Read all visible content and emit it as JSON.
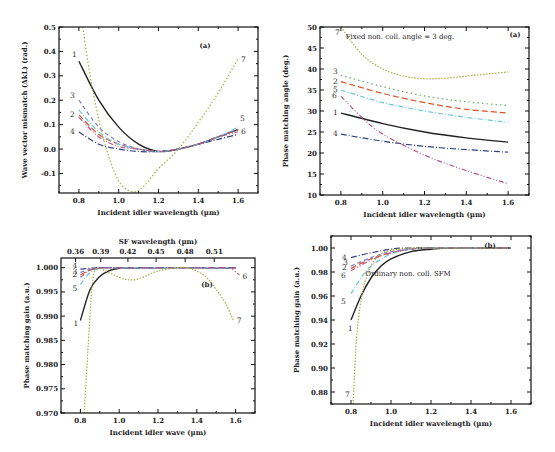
{
  "chart_data": [
    {
      "id": "top-left",
      "type": "line",
      "panel_label": "(a)",
      "title": "",
      "xlabel": "Incident idler wavelength (µm)",
      "ylabel": "Wave vector mismatch (ΔkL) (rad.)",
      "xlim": [
        0.7,
        1.7
      ],
      "ylim": [
        -0.18,
        0.5
      ],
      "xticks": [
        0.8,
        1.0,
        1.2,
        1.4,
        1.6
      ],
      "xtick_labels": [
        "0.8",
        "1.0",
        "1.2",
        "1.4",
        "1.6"
      ],
      "yticks": [
        -0.1,
        0.0,
        0.1,
        0.2,
        0.3,
        0.4,
        0.5
      ],
      "ytick_labels": [
        "-0.1",
        "0.0",
        "0.1",
        "0.2",
        "0.3",
        "0.4",
        "0.5"
      ],
      "grid": false,
      "series": [
        {
          "name": "1",
          "color": "#222222",
          "dash": "",
          "x": [
            0.8,
            0.9,
            1.0,
            1.1,
            1.2,
            1.3,
            1.4,
            1.5,
            1.6
          ],
          "y": [
            0.36,
            0.2,
            0.09,
            0.02,
            -0.01,
            0.0,
            0.02,
            0.05,
            0.08
          ]
        },
        {
          "name": "2",
          "color": "#d9532b",
          "dash": "6,3",
          "x": [
            0.8,
            0.9,
            1.0,
            1.1,
            1.2,
            1.3,
            1.4,
            1.5,
            1.6
          ],
          "y": [
            0.14,
            0.06,
            0.02,
            0.0,
            -0.01,
            0.0,
            0.02,
            0.05,
            0.08
          ]
        },
        {
          "name": "3",
          "color": "#7a7ad0",
          "dash": "4,3",
          "x": [
            0.8,
            0.9,
            1.0,
            1.1,
            1.2,
            1.3,
            1.4,
            1.5,
            1.6
          ],
          "y": [
            0.2,
            0.09,
            0.03,
            0.0,
            -0.01,
            0.0,
            0.02,
            0.05,
            0.08
          ]
        },
        {
          "name": "4",
          "color": "#33407a",
          "dash": "6,2,1,2",
          "x": [
            0.8,
            0.9,
            1.0,
            1.1,
            1.2,
            1.3,
            1.4,
            1.5,
            1.6
          ],
          "y": [
            0.07,
            0.02,
            0.0,
            -0.01,
            -0.01,
            0.0,
            0.02,
            0.04,
            0.06
          ]
        },
        {
          "name": "5",
          "color": "#6cc7d6",
          "dash": "5,2,1,2",
          "x": [
            0.8,
            0.9,
            1.0,
            1.1,
            1.2,
            1.3,
            1.4,
            1.5,
            1.6
          ],
          "y": [
            0.16,
            0.07,
            0.02,
            0.0,
            -0.01,
            0.0,
            0.02,
            0.05,
            0.09
          ]
        },
        {
          "name": "6",
          "color": "#b05a8a",
          "dash": "5,2,1,2,1,2",
          "x": [
            0.8,
            0.9,
            1.0,
            1.1,
            1.2,
            1.3,
            1.4,
            1.5,
            1.6
          ],
          "y": [
            0.13,
            0.05,
            0.01,
            0.0,
            -0.01,
            0.0,
            0.02,
            0.05,
            0.07
          ]
        },
        {
          "name": "7",
          "color": "#a8b040",
          "dash": "1.5,2",
          "x": [
            0.82,
            0.85,
            0.9,
            0.95,
            1.0,
            1.05,
            1.1,
            1.15,
            1.2,
            1.3,
            1.4,
            1.5,
            1.6
          ],
          "y": [
            0.5,
            0.33,
            0.12,
            -0.03,
            -0.13,
            -0.17,
            -0.17,
            -0.13,
            -0.08,
            0.0,
            0.11,
            0.23,
            0.37
          ]
        }
      ]
    },
    {
      "id": "top-right",
      "type": "line",
      "panel_label": "(a)",
      "annotation": "Fixed non. coll. angle = 3 deg.",
      "xlabel": "Incident idler wavelength (µm)",
      "ylabel": "Phase matching angle (deg.)",
      "xlim": [
        0.7,
        1.7
      ],
      "ylim": [
        10,
        50
      ],
      "xticks": [
        0.8,
        1.0,
        1.2,
        1.4,
        1.6
      ],
      "xtick_labels": [
        "0.8",
        "1.0",
        "1.2",
        "1.4",
        "1.6"
      ],
      "yticks": [
        10,
        15,
        20,
        25,
        30,
        35,
        40,
        45,
        50
      ],
      "ytick_labels": [
        "10",
        "15",
        "20",
        "25",
        "30",
        "35",
        "40",
        "45",
        "50"
      ],
      "grid": false,
      "series": [
        {
          "name": "1",
          "color": "#222222",
          "dash": "",
          "x": [
            0.8,
            1.0,
            1.2,
            1.4,
            1.6
          ],
          "y": [
            29.5,
            27.0,
            25.0,
            23.6,
            22.6
          ]
        },
        {
          "name": "2",
          "color": "#d9532b",
          "dash": "6,3",
          "x": [
            0.8,
            1.0,
            1.2,
            1.4,
            1.6
          ],
          "y": [
            37.0,
            34.2,
            32.0,
            30.4,
            29.5
          ]
        },
        {
          "name": "3",
          "color": "#6aaa6a",
          "dash": "1.5,3",
          "x": [
            0.8,
            1.0,
            1.2,
            1.4,
            1.6
          ],
          "y": [
            38.5,
            35.8,
            33.6,
            32.2,
            31.3
          ]
        },
        {
          "name": "4",
          "color": "#33407a",
          "dash": "6,2,1,2",
          "x": [
            0.8,
            1.0,
            1.2,
            1.4,
            1.6
          ],
          "y": [
            24.5,
            22.8,
            21.6,
            20.8,
            20.2
          ]
        },
        {
          "name": "5",
          "color": "#6cc7d6",
          "dash": "5,2,1,2",
          "x": [
            0.8,
            1.0,
            1.2,
            1.4,
            1.6
          ],
          "y": [
            35.0,
            32.0,
            30.0,
            28.5,
            27.3
          ]
        },
        {
          "name": "6",
          "color": "#b05a8a",
          "dash": "5,2,1,2,1,2",
          "x": [
            0.8,
            0.9,
            1.0,
            1.2,
            1.4,
            1.6
          ],
          "y": [
            33.5,
            28.5,
            24.5,
            19.5,
            15.8,
            12.7
          ]
        },
        {
          "name": "7",
          "color": "#a8b040",
          "dash": "1.5,1.5",
          "x": [
            0.8,
            0.9,
            1.0,
            1.1,
            1.2,
            1.3,
            1.4,
            1.5,
            1.6
          ],
          "y": [
            50.0,
            43.5,
            40.0,
            38.3,
            37.7,
            37.8,
            38.3,
            38.8,
            39.3
          ]
        }
      ]
    },
    {
      "id": "bottom-left",
      "type": "line",
      "panel_label": "(b)",
      "xlabel": "Incident idler wave (µm)",
      "ylabel": "Phase matching gain (a.u.)",
      "x2label": "SF wavelength (µm)",
      "xlim": [
        0.7,
        1.7
      ],
      "ylim": [
        0.97,
        1.002
      ],
      "xticks": [
        0.8,
        1.0,
        1.2,
        1.4,
        1.6
      ],
      "xtick_labels": [
        "0.8",
        "1.0",
        "1.2",
        "1.4",
        "1.6"
      ],
      "x2tick_labels": [
        "0.36",
        "0.39",
        "0.42",
        "0.45",
        "0.48",
        "0.51"
      ],
      "x2tick_positions_x": [
        0.775,
        0.905,
        1.045,
        1.19,
        1.34,
        1.49
      ],
      "yticks": [
        0.97,
        0.975,
        0.98,
        0.985,
        0.99,
        0.995,
        1.0
      ],
      "ytick_labels": [
        "0.970",
        "0.975",
        "0.980",
        "0.985",
        "0.990",
        "0.995",
        "1.000"
      ],
      "grid": false,
      "series": [
        {
          "name": "1",
          "color": "#222222",
          "dash": "",
          "x": [
            0.8,
            0.85,
            0.9,
            0.95,
            1.0,
            1.05,
            1.6
          ],
          "y": [
            0.9891,
            0.9955,
            0.9982,
            0.9994,
            0.9999,
            1.0,
            1.0
          ]
        },
        {
          "name": "2",
          "color": "#d9532b",
          "dash": "6,3",
          "x": [
            0.8,
            0.85,
            0.9,
            1.0,
            1.6
          ],
          "y": [
            0.9985,
            0.9995,
            0.9999,
            1.0,
            1.0
          ]
        },
        {
          "name": "3",
          "color": "#7a7ad0",
          "dash": "4,3",
          "x": [
            0.8,
            0.85,
            0.9,
            1.0,
            1.6
          ],
          "y": [
            0.999,
            0.9997,
            1.0,
            1.0,
            1.0
          ]
        },
        {
          "name": "4",
          "color": "#33407a",
          "dash": "6,2,1,2",
          "x": [
            0.8,
            0.85,
            0.9,
            1.0,
            1.6
          ],
          "y": [
            0.9997,
            0.9999,
            1.0,
            1.0,
            1.0
          ]
        },
        {
          "name": "5",
          "color": "#6cc7d6",
          "dash": "5,2,1,2",
          "x": [
            0.8,
            0.85,
            0.9,
            1.0,
            1.6
          ],
          "y": [
            0.9965,
            0.999,
            0.9998,
            1.0,
            1.0
          ]
        },
        {
          "name": "6",
          "color": "#b05a8a",
          "dash": "5,2,1,2,1,2",
          "x": [
            0.8,
            0.85,
            0.9,
            1.0,
            1.55,
            1.58,
            1.62
          ],
          "y": [
            0.998,
            0.9995,
            0.9999,
            1.0,
            1.0,
            0.9997,
            0.9985
          ]
        },
        {
          "name": "7",
          "color": "#a8b040",
          "dash": "1.5,1.5",
          "x": [
            0.82,
            0.84,
            0.86,
            0.88,
            0.92,
            1.0,
            1.05,
            1.1,
            1.2,
            1.3,
            1.35,
            1.4,
            1.45,
            1.5,
            1.55,
            1.59
          ],
          "y": [
            0.97,
            0.984,
            0.996,
            0.9998,
            0.9995,
            0.998,
            0.9975,
            0.9977,
            0.9993,
            1.0,
            1.0,
            0.9993,
            0.998,
            0.9955,
            0.9925,
            0.989
          ]
        }
      ]
    },
    {
      "id": "bottom-right",
      "type": "line",
      "panel_label": "(b)",
      "annotation": "Ordinary non. coll. SFM",
      "xlabel": "Incident idler wavelength (µm)",
      "ylabel": "Phase matching gain (a.u.)",
      "xlim": [
        0.7,
        1.7
      ],
      "ylim": [
        0.87,
        1.01
      ],
      "xticks": [
        0.8,
        1.0,
        1.2,
        1.4,
        1.6
      ],
      "xtick_labels": [
        "0.8",
        "1.0",
        "1.2",
        "1.4",
        "1.6"
      ],
      "yticks": [
        0.88,
        0.9,
        0.92,
        0.94,
        0.96,
        0.98,
        1.0
      ],
      "ytick_labels": [
        "0.88",
        "0.90",
        "0.92",
        "0.94",
        "0.96",
        "0.98",
        "1.00"
      ],
      "grid": false,
      "series": [
        {
          "name": "1",
          "color": "#222222",
          "dash": "",
          "x": [
            0.8,
            0.85,
            0.9,
            0.95,
            1.0,
            1.1,
            1.2,
            1.3,
            1.6
          ],
          "y": [
            0.94,
            0.96,
            0.975,
            0.985,
            0.991,
            0.997,
            0.999,
            1.0,
            1.0
          ]
        },
        {
          "name": "2",
          "color": "#d9532b",
          "dash": "6,3",
          "x": [
            0.8,
            0.9,
            1.0,
            1.1,
            1.2,
            1.6
          ],
          "y": [
            0.983,
            0.991,
            0.996,
            0.999,
            1.0,
            1.0
          ]
        },
        {
          "name": "3",
          "color": "#7a7ad0",
          "dash": "4,3",
          "x": [
            0.8,
            0.9,
            1.0,
            1.1,
            1.2,
            1.6
          ],
          "y": [
            0.985,
            0.992,
            0.997,
            0.999,
            1.0,
            1.0
          ]
        },
        {
          "name": "4",
          "color": "#33407a",
          "dash": "6,2,1,2",
          "x": [
            0.8,
            0.9,
            1.0,
            1.1,
            1.6
          ],
          "y": [
            0.992,
            0.996,
            0.999,
            1.0,
            1.0
          ]
        },
        {
          "name": "5",
          "color": "#6cc7d6",
          "dash": "5,2,1,2",
          "x": [
            0.8,
            0.85,
            0.9,
            1.0,
            1.1,
            1.2,
            1.6
          ],
          "y": [
            0.962,
            0.975,
            0.985,
            0.995,
            0.999,
            1.0,
            1.0
          ]
        },
        {
          "name": "6",
          "color": "#b05a8a",
          "dash": "5,2,1,2,1,2",
          "x": [
            0.8,
            0.9,
            1.0,
            1.1,
            1.2,
            1.6
          ],
          "y": [
            0.981,
            0.99,
            0.996,
            0.999,
            1.0,
            1.0
          ]
        },
        {
          "name": "7",
          "color": "#a8b040",
          "dash": "1.5,1.5",
          "x": [
            0.81,
            0.83,
            0.86,
            0.9,
            0.95,
            1.0,
            1.1,
            1.2,
            1.6
          ],
          "y": [
            0.87,
            0.93,
            0.965,
            0.985,
            0.995,
            0.998,
            1.0,
            1.0,
            1.0
          ]
        }
      ]
    }
  ]
}
